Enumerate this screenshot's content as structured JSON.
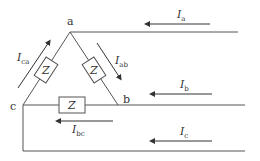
{
  "diagram": {
    "nodes": [
      {
        "id": "a",
        "label": "a"
      },
      {
        "id": "b",
        "label": "b"
      },
      {
        "id": "c",
        "label": "c"
      }
    ],
    "impedances": [
      {
        "branch": "ca",
        "label": "Z"
      },
      {
        "branch": "ab",
        "label": "Z"
      },
      {
        "branch": "bc",
        "label": "Z"
      }
    ],
    "line_currents": [
      {
        "symbol": "I",
        "sub": "a"
      },
      {
        "symbol": "I",
        "sub": "b"
      },
      {
        "symbol": "I",
        "sub": "c"
      }
    ],
    "phase_currents": [
      {
        "symbol": "I",
        "sub": "ca"
      },
      {
        "symbol": "I",
        "sub": "ab"
      },
      {
        "symbol": "I",
        "sub": "bc"
      }
    ],
    "colors": {
      "line": "#555555",
      "text": "#333333",
      "background": "#ffffff"
    }
  }
}
